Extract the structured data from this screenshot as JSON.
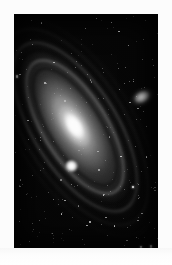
{
  "image": {
    "kind": "astronomical-photograph",
    "subject": "Andromeda Galaxy",
    "catalog_designation": "M31",
    "rendering": "grayscale",
    "caption": "",
    "canvas": {
      "width": 172,
      "height": 265
    },
    "plate": {
      "border_color": "#fcfcfc",
      "sky_color": "#050505",
      "exposed_area": {
        "x": 14,
        "y": 14,
        "width": 144,
        "height": 234
      }
    }
  },
  "colors": {
    "paper_white": "#fcfcfc",
    "sky_black": "#050505",
    "core_white": "#ffffff",
    "halo_gray": "#b4b4b4",
    "dust_lane": "#040404",
    "star_white": "#ffffff"
  },
  "objects": {
    "main_galaxy": {
      "name": "Andromeda Galaxy",
      "designation": "M31",
      "type": "spiral-galaxy",
      "center_x": 75,
      "center_y": 128,
      "position_angle_deg": -32,
      "arm_count": 4,
      "dust_lane_count": 4
    },
    "companions": [
      {
        "name": "M110",
        "designation": "NGC 205",
        "type": "dwarf-elliptical-galaxy",
        "center_x": 128,
        "center_y": 83,
        "appearance": "diffuse-elongated-glow"
      },
      {
        "name": "M32",
        "designation": "NGC 221",
        "type": "compact-elliptical-galaxy",
        "center_x": 72,
        "center_y": 166,
        "appearance": "bright-compact-knot"
      }
    ]
  },
  "starfield": {
    "description": "dense scattered foreground stars across the full plate",
    "star_count": 240
  }
}
